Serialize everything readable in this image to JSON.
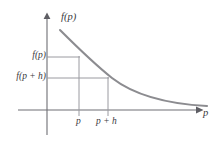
{
  "figure": {
    "kind": "math-function-graph",
    "background_color": "#ffffff",
    "curve_color": "#8c8c90",
    "axis_color": "#6e6e74",
    "guide_color": "#9a9aa0",
    "text_color": "#3a3a40"
  },
  "axes": {
    "y_axis_label": "f(p)",
    "x_axis_label": "p",
    "origin_px": {
      "x": 47,
      "y": 110
    },
    "y_axis_top_px": 15,
    "y_axis_bottom_px": 135,
    "x_axis_left_px": 18,
    "x_axis_right_px": 200,
    "y_arrow": true,
    "x_arrow": true,
    "grid": false
  },
  "y_ticks": [
    {
      "label": "f(p)",
      "y_px": 57,
      "guide_to_x_px": 79
    },
    {
      "label": "f(p + h)",
      "y_px": 78,
      "guide_to_x_px": 108
    }
  ],
  "x_ticks": [
    {
      "label": "p",
      "x_px": 79,
      "drop_from_y_px": 57
    },
    {
      "label": "p + h",
      "x_px": 108,
      "drop_from_y_px": 78
    }
  ],
  "chart_data": {
    "type": "line",
    "title": "",
    "xlabel": "p",
    "ylabel": "f(p)",
    "curve_path_px": "M 60,30 C 78,48 92,62 112,78 C 134,95 168,104 207,106",
    "x": [
      60,
      70,
      79,
      90,
      100,
      108,
      120,
      135,
      150,
      165,
      180,
      195,
      207
    ],
    "y_px": [
      30,
      40,
      48,
      59,
      69,
      76,
      85,
      93,
      98,
      101,
      103,
      105,
      106
    ],
    "annotations": [
      {
        "text": "f(p)",
        "at_x_px": 47,
        "at_y_px": 57,
        "role": "y-value-at-p"
      },
      {
        "text": "f(p + h)",
        "at_x_px": 47,
        "at_y_px": 78,
        "role": "y-value-at-p-plus-h"
      },
      {
        "text": "p",
        "at_x_px": 79,
        "at_y_px": 122,
        "role": "x-tick"
      },
      {
        "text": "p + h",
        "at_x_px": 108,
        "at_y_px": 122,
        "role": "x-tick"
      }
    ],
    "legend": [],
    "grid": false
  }
}
